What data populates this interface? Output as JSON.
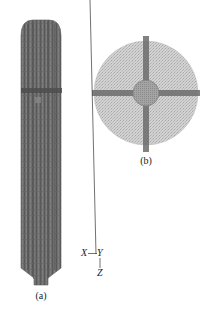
{
  "figure": {
    "panel_a": {
      "caption": "(a)",
      "description": "column mesh side view",
      "colors": {
        "body": "#6e6e6e",
        "stripe_dark": "#555555",
        "stripe_light": "#8a8a8a",
        "band": "#4a4a4a"
      }
    },
    "panel_b": {
      "caption": "(b)",
      "description": "column mesh cross-section top view",
      "colors": {
        "disk": "#c9c9c9",
        "hub": "#9a9a9a",
        "spokes": "#6a6a6a"
      }
    },
    "axes": {
      "x_label": "X",
      "y_label": "Y",
      "z_label": "Z"
    }
  }
}
